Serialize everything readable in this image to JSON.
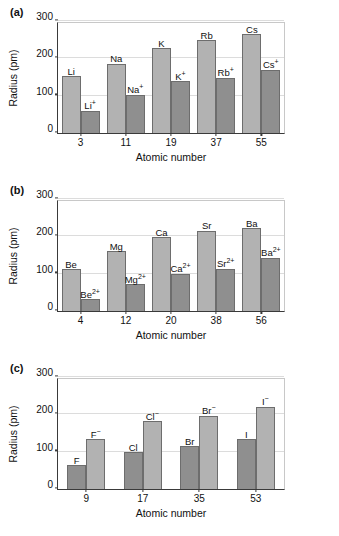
{
  "figure": {
    "panels": [
      {
        "label": "(a)"
      },
      {
        "label": "(b)"
      },
      {
        "label": "(c)"
      }
    ]
  },
  "axes": {
    "ylabel": "Radius (pm)",
    "xlabel": "Atomic number",
    "yticks": [
      "0",
      "100",
      "200",
      "300"
    ]
  },
  "chart_data": [
    {
      "type": "bar",
      "panel": "(a)",
      "title": "",
      "xlabel": "Atomic number",
      "ylabel": "Radius (pm)",
      "ylim": [
        0,
        300
      ],
      "yticks": [
        0,
        100,
        200,
        300
      ],
      "grid": true,
      "legend": "none",
      "categories": [
        "3",
        "11",
        "19",
        "37",
        "55"
      ],
      "series": [
        {
          "name": "Neutral atom",
          "style": "light",
          "labels": [
            "Li",
            "Na",
            "K",
            "Rb",
            "Cs"
          ],
          "values": [
            152,
            186,
            227,
            248,
            265
          ]
        },
        {
          "name": "Cation",
          "style": "dark",
          "labels": [
            "Li+",
            "Na+",
            "K+",
            "Rb+",
            "Cs+"
          ],
          "label_base": [
            "Li",
            "Na",
            "K",
            "Rb",
            "Cs"
          ],
          "label_sup": [
            "+",
            "+",
            "+",
            "+",
            "+"
          ],
          "values": [
            60,
            102,
            138,
            148,
            170
          ]
        }
      ]
    },
    {
      "type": "bar",
      "panel": "(b)",
      "title": "",
      "xlabel": "Atomic number",
      "ylabel": "Radius (pm)",
      "ylim": [
        0,
        300
      ],
      "yticks": [
        0,
        100,
        200,
        300
      ],
      "grid": true,
      "legend": "none",
      "categories": [
        "4",
        "12",
        "20",
        "38",
        "56"
      ],
      "series": [
        {
          "name": "Neutral atom",
          "style": "light",
          "labels": [
            "Be",
            "Mg",
            "Ca",
            "Sr",
            "Ba"
          ],
          "values": [
            112,
            160,
            197,
            215,
            222
          ]
        },
        {
          "name": "Cation",
          "style": "dark",
          "labels": [
            "Be2+",
            "Mg2+",
            "Ca2+",
            "Sr2+",
            "Ba2+"
          ],
          "label_base": [
            "Be",
            "Mg",
            "Ca",
            "Sr",
            "Ba"
          ],
          "label_sup": [
            "2+",
            "2+",
            "2+",
            "2+",
            "2+"
          ],
          "values": [
            31,
            72,
            100,
            113,
            143
          ]
        }
      ]
    },
    {
      "type": "bar",
      "panel": "(c)",
      "title": "",
      "xlabel": "Atomic number",
      "ylabel": "Radius (pm)",
      "ylim": [
        0,
        300
      ],
      "yticks": [
        0,
        100,
        200,
        300
      ],
      "grid": true,
      "legend": "none",
      "categories": [
        "9",
        "17",
        "35",
        "53"
      ],
      "series": [
        {
          "name": "Neutral atom",
          "style": "dark",
          "labels": [
            "F",
            "Cl",
            "Br",
            "I"
          ],
          "values": [
            64,
            99,
            114,
            133
          ]
        },
        {
          "name": "Anion",
          "style": "light",
          "labels": [
            "F-",
            "Cl-",
            "Br-",
            "I-"
          ],
          "label_base": [
            "F",
            "Cl",
            "Br",
            "I"
          ],
          "label_sup": [
            "−",
            "−",
            "−",
            "−"
          ],
          "values": [
            133,
            181,
            196,
            220
          ]
        }
      ]
    }
  ],
  "colors": {
    "bar_light": "#b2b2b2",
    "bar_dark": "#8f8f8f",
    "bar_stroke": "#6d6d6d",
    "axis": "#3a3a3a",
    "grid": "#dcdcdc",
    "text": "#111111",
    "background": "#ffffff"
  }
}
